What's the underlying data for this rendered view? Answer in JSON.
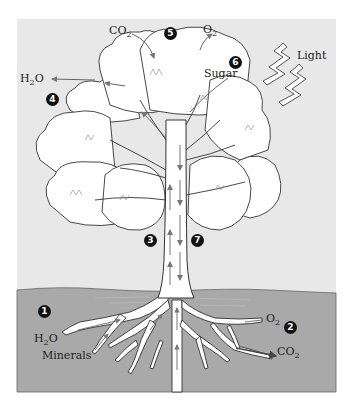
{
  "figure": {
    "colors": {
      "page_background": "#ffffff",
      "sky_panel": "#e8e8e8",
      "ground": "#a9a9a9",
      "tree_fill": "#ffffff",
      "outline": "#333333",
      "arrow": "#777777",
      "badge": "#111111"
    }
  },
  "labels": {
    "co2_top": {
      "base": "CO",
      "sub": "2"
    },
    "o2_top": {
      "base": "O",
      "sub": "2"
    },
    "h2o_leaf": {
      "base": "H",
      "sub": "2",
      "tail": "O"
    },
    "sugar": "Sugar",
    "light": "Light",
    "h2o_root": {
      "base": "H",
      "sub": "2",
      "tail": "O"
    },
    "minerals": "Minerals",
    "o2_root": {
      "base": "O",
      "sub": "2"
    },
    "co2_root": {
      "base": "CO",
      "sub": "2"
    }
  },
  "badges": {
    "b1": "1",
    "b2": "2",
    "b3": "3",
    "b4": "4",
    "b5": "5",
    "b6": "6",
    "b7": "7"
  }
}
